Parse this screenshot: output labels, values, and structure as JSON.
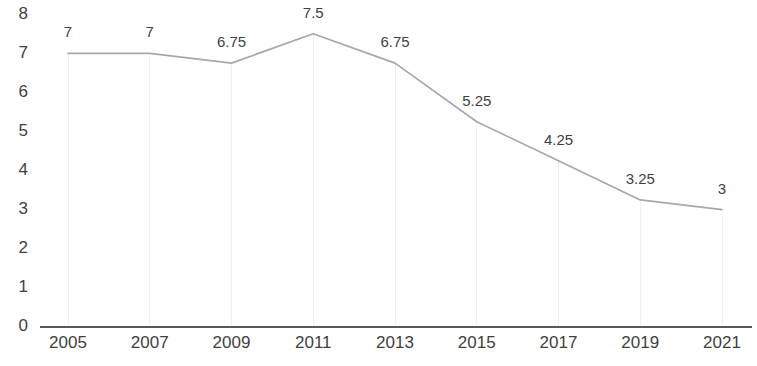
{
  "chart_data": {
    "type": "line",
    "title": "",
    "subtitle": "",
    "xlabel": "",
    "ylabel": "",
    "categories": [
      "2005",
      "2007",
      "2009",
      "2011",
      "2013",
      "2015",
      "2017",
      "2019",
      "2021"
    ],
    "values": [
      7,
      7,
      6.75,
      7.5,
      6.75,
      5.25,
      4.25,
      3.25,
      3
    ],
    "point_labels": [
      "7",
      "7",
      "6.75",
      "7.5",
      "6.75",
      "5.25",
      "4.25",
      "3.25",
      "3"
    ],
    "ylim": [
      0,
      8
    ],
    "ytick_labels": [
      "8",
      "7",
      "6",
      "5",
      "4",
      "3",
      "2",
      "1",
      "0"
    ],
    "ytick_values": [
      8,
      7,
      6,
      5,
      4,
      3,
      2,
      1,
      0
    ],
    "grid": "vertical-only",
    "legend": "none",
    "markers": false,
    "colors": {
      "line": "#a8a8a8",
      "axis": "#595959",
      "gridline": "#f1f1f1",
      "text": "#3f3f3f",
      "background": "#ffffff"
    }
  }
}
